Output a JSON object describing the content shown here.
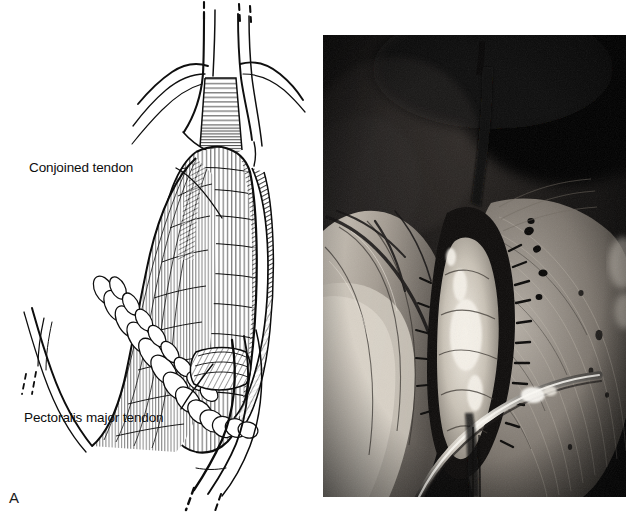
{
  "figure": {
    "type": "medical-surgical-figure",
    "width": 634,
    "height": 516,
    "background_color": "#ffffff",
    "panels": [
      {
        "id": "A",
        "letter": "A",
        "kind": "line-drawing",
        "description": "Pen-and-ink anatomical illustration of the deltopectoral approach to the shoulder, showing the conjoined tendon and pectoralis major tendon exposed between retracted tissue planes.",
        "callouts": [
          {
            "name": "conjoined-tendon",
            "label": "Conjoined tendon",
            "leader_from": [
              176,
              168
            ],
            "leader_to": [
              222,
              218
            ]
          },
          {
            "name": "pectoralis-major-tendon",
            "label": "Pectoralis major tendon",
            "leader_from": [
              181,
              409
            ],
            "leader_to": [
              213,
              364
            ]
          }
        ]
      },
      {
        "id": "B",
        "letter": "B",
        "kind": "photograph",
        "description": "Intraoperative photograph of the same deltopectoral exposure: a dark surgical field with a retracted skin flap at left, a bright open incision at centre showing exposed tendon, and a curved metal retractor crossing the lower field.",
        "bounds": {
          "left": 323,
          "top": 35,
          "width": 303,
          "height": 462
        },
        "dominant_colors": [
          "#050505",
          "#1c1c1c",
          "#6e6a66",
          "#b9b4ad",
          "#e8e4dc"
        ]
      }
    ]
  },
  "colors": {
    "page_background": "#ffffff",
    "ink": "#0d0d0d",
    "panel_a_letter": "#1a1a1a",
    "panel_b_letter": "#f2f2f2",
    "photo_dark": "#050505",
    "photo_highlight": "#efe9df"
  }
}
